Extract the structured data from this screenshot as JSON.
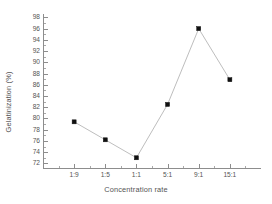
{
  "chart_data": {
    "type": "line",
    "title": "",
    "xlabel": "Concentration rate",
    "ylabel": "Gelatinization (%)",
    "categories": [
      "1:9",
      "1:5",
      "1:1",
      "5:1",
      "9:1",
      "15:1"
    ],
    "values": [
      79.4,
      76.2,
      73.0,
      82.5,
      96.0,
      86.9
    ],
    "series": [
      {
        "name": "Gelatinization",
        "values": [
          79.4,
          76.2,
          73.0,
          82.5,
          96.0,
          86.9
        ],
        "marker": "filled-square",
        "marker_color": "#101010",
        "line_color": "#b6b6b6"
      }
    ],
    "ylim": [
      71.0,
      98.6
    ],
    "xlim": [
      0,
      7
    ],
    "yticks": [
      72,
      74,
      76,
      78,
      80,
      82,
      84,
      86,
      88,
      90,
      92,
      94,
      96,
      98
    ],
    "ytick_labels": [
      "72",
      "74",
      "76",
      "78",
      "80",
      "82",
      "84",
      "86",
      "88",
      "90",
      "92",
      "94",
      "96",
      "98"
    ],
    "xtick_labels": [
      "1:9",
      "1:5",
      "1:1",
      "5:1",
      "9:1",
      "15:1"
    ],
    "grid": false,
    "legend": false,
    "tick_direction": "in",
    "minor_ticks": true,
    "axis_color": "#8d8d8d",
    "text_color": "#545454",
    "background": "#ffffff"
  }
}
